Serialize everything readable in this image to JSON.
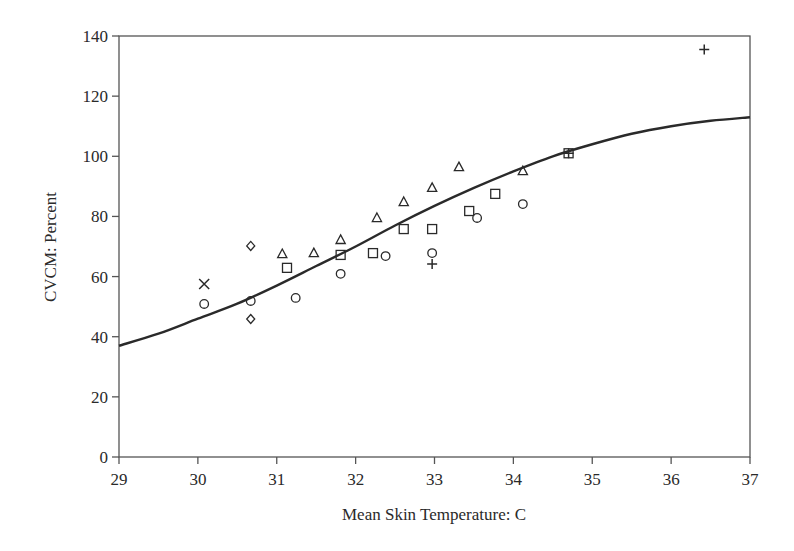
{
  "chart_data": {
    "type": "scatter",
    "title": "",
    "xlabel": "Mean Skin Temperature: C",
    "ylabel": "CVCM: Percent",
    "xlim": [
      29,
      37
    ],
    "ylim": [
      0,
      140
    ],
    "x_ticks": [
      29,
      30,
      31,
      32,
      33,
      34,
      35,
      36,
      37
    ],
    "y_ticks": [
      0,
      20,
      40,
      60,
      80,
      100,
      120,
      140
    ],
    "grid": false,
    "legend": null,
    "frame": "box",
    "series": [
      {
        "name": "circle",
        "marker": "circle",
        "points": [
          [
            30.08,
            50.9
          ],
          [
            30.67,
            51.9
          ],
          [
            31.24,
            52.9
          ],
          [
            31.81,
            60.9
          ],
          [
            32.38,
            66.8
          ],
          [
            32.97,
            67.8
          ],
          [
            33.54,
            79.5
          ],
          [
            34.12,
            84.1
          ]
        ]
      },
      {
        "name": "square",
        "marker": "square",
        "points": [
          [
            31.13,
            62.9
          ],
          [
            31.81,
            67.2
          ],
          [
            32.22,
            67.8
          ],
          [
            32.61,
            75.8
          ],
          [
            32.97,
            75.8
          ],
          [
            33.44,
            81.8
          ],
          [
            33.77,
            87.5
          ],
          [
            34.7,
            101.0
          ]
        ]
      },
      {
        "name": "triangle",
        "marker": "triangle",
        "points": [
          [
            31.07,
            67.5
          ],
          [
            31.47,
            67.8
          ],
          [
            31.81,
            72.2
          ],
          [
            32.27,
            79.5
          ],
          [
            32.61,
            84.8
          ],
          [
            32.97,
            89.5
          ],
          [
            33.31,
            96.4
          ],
          [
            34.12,
            95.1
          ]
        ]
      },
      {
        "name": "diamond",
        "marker": "diamond",
        "points": [
          [
            30.67,
            70.2
          ],
          [
            30.67,
            45.9
          ]
        ]
      },
      {
        "name": "cross",
        "marker": "x",
        "points": [
          [
            30.08,
            57.5
          ]
        ]
      },
      {
        "name": "plus",
        "marker": "plus",
        "points": [
          [
            32.97,
            64.2
          ],
          [
            34.7,
            101.0
          ],
          [
            36.42,
            135.5
          ]
        ]
      }
    ],
    "fit_curve": {
      "name": "fitted curve",
      "type": "line",
      "x": [
        29,
        29.5,
        30,
        30.5,
        31,
        31.5,
        32,
        32.5,
        33,
        33.5,
        34,
        34.5,
        35,
        35.5,
        36,
        36.5,
        37
      ],
      "y": [
        37,
        41,
        46,
        51,
        57,
        63.5,
        70,
        77,
        83.5,
        89.5,
        95,
        100,
        104,
        107.5,
        110,
        111.8,
        113
      ]
    }
  },
  "colors": {
    "ink": "#2a2a2a",
    "background": "#ffffff",
    "frame": "#555555"
  }
}
